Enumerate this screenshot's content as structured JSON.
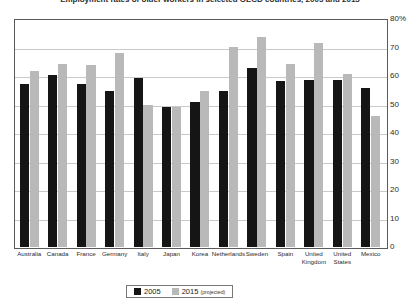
{
  "chart_data": {
    "type": "bar",
    "title": "Employment rates of older workers in selected OECD countries, 2005 and 2015",
    "xlabel": "",
    "ylabel": "",
    "ylim": [
      0,
      80
    ],
    "ytick_step": 10,
    "ytick_labels": [
      "80%",
      "70",
      "60",
      "50",
      "40",
      "30",
      "20",
      "10",
      "0"
    ],
    "ytick_values": [
      80,
      70,
      60,
      50,
      40,
      30,
      20,
      10,
      0
    ],
    "grid": true,
    "y_axis_position": "right",
    "legend_position": "bottom-center",
    "categories": [
      "Australia",
      "Canada",
      "France",
      "Germany",
      "Italy",
      "Japan",
      "Korea",
      "Netherlands",
      "Sweden",
      "Spain",
      "United Kingdom",
      "United States",
      "Mexico"
    ],
    "series": [
      {
        "name": "2005",
        "color": "#151515",
        "values": [
          57.5,
          60.5,
          57.5,
          55.0,
          59.5,
          49.5,
          51.0,
          55.0,
          63.0,
          58.5,
          59.0,
          59.0,
          56.0
        ]
      },
      {
        "name": "2015 (projected)",
        "color": "#b9b9b9",
        "values": [
          62.0,
          64.5,
          64.0,
          68.5,
          50.0,
          49.5,
          55.0,
          70.5,
          74.0,
          64.5,
          72.0,
          61.0,
          46.0
        ]
      }
    ]
  },
  "legend": {
    "entries": [
      {
        "label": "2005",
        "qualifier": ""
      },
      {
        "label": "2015",
        "qualifier": "(projected)"
      }
    ]
  }
}
